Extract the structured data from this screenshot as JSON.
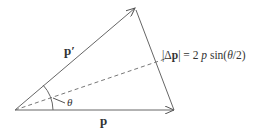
{
  "diagram": {
    "title": "",
    "vectors": [
      {
        "id": "p",
        "label": "p",
        "from": [
          15,
          110
        ],
        "to": [
          174,
          110
        ]
      },
      {
        "id": "p_prime",
        "label": "p′",
        "from": [
          15,
          110
        ],
        "to": [
          135,
          8
        ]
      },
      {
        "id": "delta_p",
        "label": "Δp",
        "from": [
          174,
          110
        ],
        "to": [
          135,
          8
        ]
      }
    ],
    "bisector": {
      "style": "dashed",
      "from": [
        15,
        110
      ],
      "to": [
        165,
        59
      ]
    },
    "angle_label": "θ",
    "labels": {
      "p": "p",
      "p_prime": "p′",
      "theta": "θ",
      "formula_bar_left": "|",
      "formula_delta": "Δ",
      "formula_p": "p",
      "formula_bar_right": "|",
      "formula_rhs_1": " = 2 ",
      "formula_rhs_p": "p",
      "formula_rhs_2": " sin(",
      "formula_rhs_theta": "θ",
      "formula_rhs_3": "/2)"
    },
    "colors": {
      "line": "#555555",
      "text": "#333333"
    }
  }
}
